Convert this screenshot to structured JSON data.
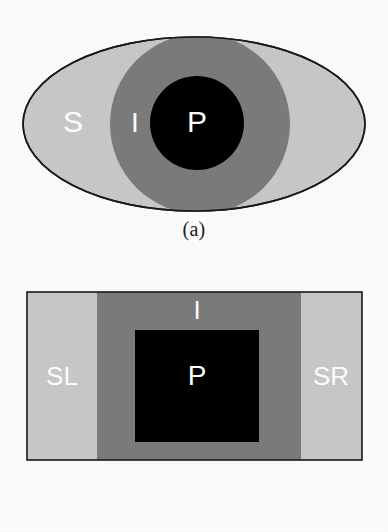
{
  "figure": {
    "background": "#fdfdfd",
    "colors": {
      "surround": "#c9c9c9",
      "intermediate": "#7c7c7c",
      "pixel": "#000000",
      "outline": "#1a1a1a",
      "label_text": "#ffffff",
      "caption_text": "#1c1c1c"
    }
  },
  "panels": [
    {
      "id": "a",
      "caption": "(a)",
      "shape": "ellipse",
      "regions": [
        {
          "key": "surround",
          "label": "S",
          "label_x": 73,
          "label_y": 124,
          "font_size": 30,
          "color": "#c9c9c9",
          "geometry": {
            "cx": 194,
            "cy": 124,
            "rx": 171,
            "ry": 87
          }
        },
        {
          "key": "intermediate",
          "label": "I",
          "label_x": 135,
          "label_y": 125,
          "font_size": 28,
          "color": "#7c7c7c",
          "geometry": {
            "cx": 200,
            "cy": 124,
            "r": 90
          }
        },
        {
          "key": "pixel",
          "label": "P",
          "label_x": 197,
          "label_y": 124,
          "font_size": 30,
          "color": "#000000",
          "geometry": {
            "cx": 197,
            "cy": 123,
            "r": 47
          }
        }
      ]
    },
    {
      "id": "b",
      "caption": "(b)",
      "shape": "rectangle",
      "frame": {
        "x": 27,
        "y": 26,
        "width": 335,
        "height": 168
      },
      "regions": [
        {
          "key": "surround_left",
          "label": "SL",
          "label_x": 62,
          "label_y": 112,
          "font_size": 26,
          "color": "#c9c9c9",
          "geometry": {
            "x": 27,
            "y": 26,
            "width": 70,
            "height": 168
          }
        },
        {
          "key": "intermediate",
          "label": "I",
          "label_x": 197,
          "label_y": 46,
          "font_size": 26,
          "color": "#7c7c7c",
          "geometry": {
            "x": 97,
            "y": 26,
            "width": 204,
            "height": 168
          }
        },
        {
          "key": "surround_right",
          "label": "SR",
          "label_x": 331,
          "label_y": 112,
          "font_size": 26,
          "color": "#c9c9c9",
          "geometry": {
            "x": 301,
            "y": 26,
            "width": 61,
            "height": 168
          }
        },
        {
          "key": "pixel",
          "label": "P",
          "label_x": 197,
          "label_y": 112,
          "font_size": 28,
          "color": "#000000",
          "geometry": {
            "x": 135,
            "y": 64,
            "width": 124,
            "height": 112
          }
        }
      ]
    }
  ]
}
